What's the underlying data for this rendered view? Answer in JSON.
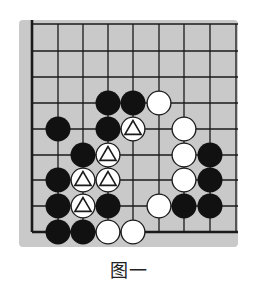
{
  "figure": {
    "caption": "图一",
    "board": {
      "size_visible": {
        "cols": 9,
        "rows": 9
      },
      "background_color": "#c9c9c9",
      "line_color": "#1a1a1a",
      "edges": {
        "left": "board-edge",
        "bottom": "board-edge",
        "top": "continues",
        "right": "continues"
      },
      "col_x": [
        32,
        58,
        83,
        108,
        133,
        159,
        184,
        210,
        236
      ],
      "row_y": [
        24,
        51,
        77,
        103,
        129,
        155,
        180,
        206,
        232
      ],
      "stone_radius": 12.5,
      "stones": [
        {
          "row": 3,
          "col": 3,
          "color": "black"
        },
        {
          "row": 3,
          "col": 4,
          "color": "black"
        },
        {
          "row": 3,
          "col": 5,
          "color": "white"
        },
        {
          "row": 4,
          "col": 1,
          "color": "black"
        },
        {
          "row": 4,
          "col": 3,
          "color": "black"
        },
        {
          "row": 4,
          "col": 4,
          "color": "white",
          "mark": "triangle"
        },
        {
          "row": 4,
          "col": 6,
          "color": "white"
        },
        {
          "row": 5,
          "col": 2,
          "color": "black"
        },
        {
          "row": 5,
          "col": 3,
          "color": "white",
          "mark": "triangle"
        },
        {
          "row": 5,
          "col": 6,
          "color": "white"
        },
        {
          "row": 5,
          "col": 7,
          "color": "black"
        },
        {
          "row": 6,
          "col": 1,
          "color": "black"
        },
        {
          "row": 6,
          "col": 2,
          "color": "white",
          "mark": "triangle"
        },
        {
          "row": 6,
          "col": 3,
          "color": "white",
          "mark": "triangle"
        },
        {
          "row": 6,
          "col": 6,
          "color": "white"
        },
        {
          "row": 6,
          "col": 7,
          "color": "black"
        },
        {
          "row": 7,
          "col": 1,
          "color": "black"
        },
        {
          "row": 7,
          "col": 2,
          "color": "white",
          "mark": "triangle"
        },
        {
          "row": 7,
          "col": 3,
          "color": "black"
        },
        {
          "row": 7,
          "col": 5,
          "color": "white"
        },
        {
          "row": 7,
          "col": 6,
          "color": "black"
        },
        {
          "row": 7,
          "col": 7,
          "color": "black"
        },
        {
          "row": 8,
          "col": 1,
          "color": "black"
        },
        {
          "row": 8,
          "col": 2,
          "color": "black"
        },
        {
          "row": 8,
          "col": 3,
          "color": "white"
        },
        {
          "row": 8,
          "col": 4,
          "color": "white"
        }
      ]
    }
  }
}
